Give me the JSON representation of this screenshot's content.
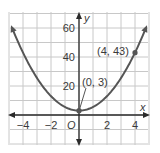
{
  "chart_data": {
    "type": "line",
    "title": "",
    "function": "y = 2.5x^2 + 3",
    "xlabel": "x",
    "ylabel": "y",
    "origin_label": "O",
    "xlim": [
      -5,
      5
    ],
    "ylim": [
      -20,
      70
    ],
    "x_ticks": [
      -4,
      -2,
      2,
      4
    ],
    "x_tick_labels": [
      "−4",
      "−2",
      "2",
      "4"
    ],
    "y_ticks": [
      20,
      40,
      60
    ],
    "y_tick_labels": [
      "20",
      "40",
      "60"
    ],
    "grid": true,
    "grid_x_step": 1,
    "grid_y_step": 10,
    "series": [
      {
        "name": "parabola",
        "color": "#555555",
        "arrows_both_ends": true,
        "x": [
          -5,
          -4,
          -3,
          -2,
          -1,
          0,
          1,
          2,
          3,
          4,
          5
        ],
        "values": [
          65.5,
          43,
          25.5,
          13,
          5.5,
          3,
          5.5,
          13,
          25.5,
          43,
          65.5
        ]
      }
    ],
    "points": [
      {
        "x": 0,
        "y": 3,
        "label": "(0, 3)"
      },
      {
        "x": 4,
        "y": 43,
        "label": "(4, 43)"
      }
    ]
  },
  "colors": {
    "grid": "#c8c8c8",
    "axis": "#2a2a2a",
    "curve": "#555555",
    "text": "#3a3a3a"
  }
}
